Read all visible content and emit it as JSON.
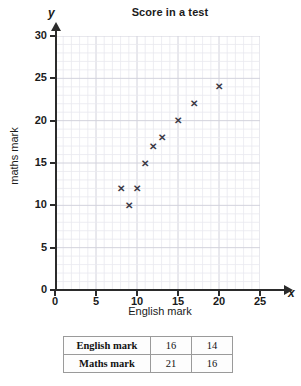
{
  "chart_data": {
    "type": "scatter",
    "title": "Score in a test",
    "xlabel": "English mark",
    "ylabel": "maths mark",
    "x_axis_symbol": "x",
    "y_axis_symbol": "y",
    "xlim": [
      0,
      25
    ],
    "ylim": [
      0,
      30
    ],
    "x_ticks": [
      0,
      5,
      10,
      15,
      20,
      25
    ],
    "y_ticks": [
      0,
      5,
      10,
      15,
      20,
      25,
      30
    ],
    "x_tick_labels": [
      "0",
      "5",
      "10",
      "15",
      "20",
      "25"
    ],
    "y_tick_labels": [
      "0",
      "5",
      "10",
      "15",
      "20",
      "25",
      "30"
    ],
    "grid": true,
    "grid_minor_step": 1,
    "grid_major_step": 5,
    "legend": null,
    "marker": "x",
    "marker_color": "#3a3a46",
    "points": [
      {
        "x": 8,
        "y": 12
      },
      {
        "x": 9,
        "y": 10
      },
      {
        "x": 10,
        "y": 12
      },
      {
        "x": 11,
        "y": 15
      },
      {
        "x": 12,
        "y": 17
      },
      {
        "x": 13,
        "y": 18
      },
      {
        "x": 15,
        "y": 20
      },
      {
        "x": 17,
        "y": 22
      },
      {
        "x": 20,
        "y": 24
      }
    ]
  },
  "table": {
    "rows": [
      {
        "header": "English mark",
        "values": [
          "16",
          "14"
        ]
      },
      {
        "header": "Maths mark",
        "values": [
          "21",
          "16"
        ]
      }
    ]
  },
  "colors": {
    "axis": "#2b2b2b",
    "grid_minor": "#e9e9ef",
    "grid_major": "#d2d2dc",
    "marker": "#3a3a46",
    "table_border": "#9a9a9a",
    "text": "#1b1b1b"
  }
}
